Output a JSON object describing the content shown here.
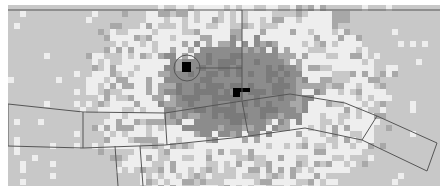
{
  "map": {
    "background_color": "#c8c8c8",
    "cell_size": 6,
    "colors": {
      "empty": "#c8c8c8",
      "light": "#eeeeee",
      "mid": "#a8a8a8",
      "dark": "#8c8c8c",
      "darker": "#7a7a7a",
      "marker": "#000000",
      "line": "#555555"
    },
    "hotspot": {
      "cx": 232,
      "cy": 85,
      "rx": 70,
      "ry": 45
    },
    "halo": {
      "cx": 235,
      "cy": 95,
      "rx": 150,
      "ry": 110
    },
    "circle_marker": {
      "cx": 187,
      "cy": 68,
      "r": 13
    },
    "black_markers": [
      {
        "x": 182,
        "y": 62,
        "w": 9,
        "h": 10
      },
      {
        "x": 233,
        "y": 88,
        "w": 7,
        "h": 9
      },
      {
        "x": 240,
        "y": 88,
        "w": 10,
        "h": 4
      }
    ],
    "polylines": [
      [
        [
          8,
          10
        ],
        [
          440,
          10
        ]
      ],
      [
        [
          242,
          10
        ],
        [
          242,
          100
        ]
      ],
      [
        [
          196,
          68
        ],
        [
          242,
          68
        ]
      ],
      [
        [
          8,
          104
        ],
        [
          83,
          112
        ],
        [
          165,
          113
        ],
        [
          242,
          101
        ],
        [
          290,
          94
        ],
        [
          345,
          103
        ],
        [
          377,
          116
        ],
        [
          437,
          143
        ],
        [
          427,
          171
        ],
        [
          362,
          140
        ],
        [
          305,
          128
        ],
        [
          242,
          137
        ],
        [
          165,
          145
        ],
        [
          83,
          148
        ],
        [
          8,
          146
        ],
        [
          8,
          104
        ]
      ],
      [
        [
          83,
          112
        ],
        [
          83,
          148
        ]
      ],
      [
        [
          165,
          113
        ],
        [
          167,
          145
        ]
      ],
      [
        [
          242,
          101
        ],
        [
          248,
          133
        ]
      ],
      [
        [
          377,
          116
        ],
        [
          362,
          140
        ]
      ],
      [
        [
          115,
          146
        ],
        [
          118,
          186
        ]
      ],
      [
        [
          140,
          146
        ],
        [
          143,
          186
        ]
      ]
    ]
  }
}
